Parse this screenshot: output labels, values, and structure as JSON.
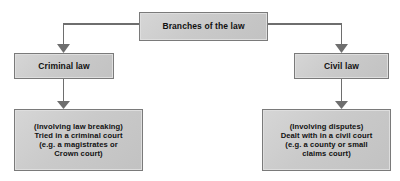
{
  "diagram": {
    "type": "flowchart",
    "title": "Branches of the law",
    "orientation": "top-down",
    "colors": {
      "box_fill": "#cacaca",
      "box_border": "#7a7a7a",
      "connector": "#6e6e6e",
      "text": "#111111",
      "background": "#ffffff"
    },
    "nodes": {
      "root": {
        "label": "Branches of the law"
      },
      "criminal": {
        "label": "Criminal law"
      },
      "civil": {
        "label": "Civil law"
      },
      "criminal_detail": {
        "label": "(Involving law breaking)\nTried in a criminal court\n(e.g. a magistrates or\nCrown court)"
      },
      "civil_detail": {
        "label": "(Involving disputes)\nDealt with in a civil court\n(e.g. a county or small\nclaims court)"
      }
    },
    "connectors": [
      {
        "name": "root-to-criminal",
        "from": "root",
        "to": "criminal",
        "arrow": "down"
      },
      {
        "name": "root-to-civil",
        "from": "root",
        "to": "civil",
        "arrow": "down"
      },
      {
        "name": "criminal-to-detail",
        "from": "criminal",
        "to": "criminal_detail",
        "arrow": "down"
      },
      {
        "name": "civil-to-detail",
        "from": "civil",
        "to": "civil_detail",
        "arrow": "down"
      }
    ]
  }
}
